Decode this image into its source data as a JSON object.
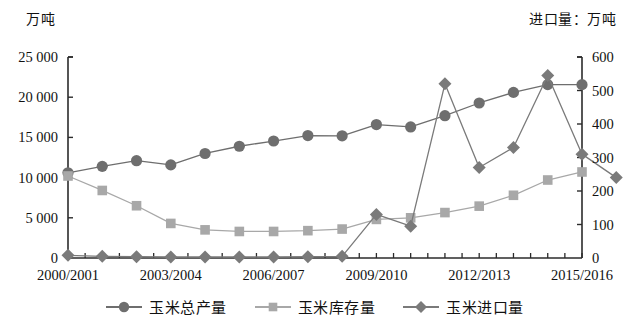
{
  "chart_data": {
    "type": "line",
    "title": "",
    "categories": [
      "2000/2001",
      "2001/2002",
      "2002/2003",
      "2003/2004",
      "2004/2005",
      "2005/2006",
      "2006/2007",
      "2007/2008",
      "2008/2009",
      "2009/2010",
      "2010/2011",
      "2011/2012",
      "2012/2013",
      "2013/2014",
      "2014/2015",
      "2015/2016"
    ],
    "x_tick_labels": [
      "2000/2001",
      "2003/2004",
      "2006/2007",
      "2009/2010",
      "2012/2013",
      "2015/2016"
    ],
    "x_tick_indices": [
      0,
      3,
      6,
      9,
      12,
      15
    ],
    "left_axis": {
      "label": "万吨",
      "ticks": [
        "0",
        "5 000",
        "10 000",
        "15 000",
        "20 000",
        "25 000"
      ],
      "values": [
        0,
        5000,
        10000,
        15000,
        20000,
        25000
      ],
      "min": 0,
      "max": 25000
    },
    "right_axis": {
      "label": "进口量：万吨",
      "ticks": [
        "0",
        "100",
        "200",
        "300",
        "400",
        "500",
        "600"
      ],
      "values": [
        0,
        100,
        200,
        300,
        400,
        500,
        600
      ],
      "min": 0,
      "max": 600
    },
    "grid": false,
    "legend_position": "bottom",
    "series": [
      {
        "name": "玉米总产量",
        "marker": "circle",
        "axis": "left",
        "color": "#6e6e6e",
        "values": [
          10600,
          11400,
          12100,
          11580,
          13000,
          13900,
          14550,
          15230,
          15200,
          16600,
          16300,
          17700,
          19280,
          20600,
          21560,
          21560
        ]
      },
      {
        "name": "玉米库存量",
        "marker": "square",
        "axis": "left",
        "color": "#a8a8a8",
        "values": [
          10200,
          8400,
          6500,
          4300,
          3500,
          3300,
          3300,
          3400,
          3600,
          4800,
          5000,
          5650,
          6450,
          7800,
          9700,
          10700
        ]
      },
      {
        "name": "玉米进口量",
        "marker": "diamond",
        "axis": "right",
        "color": "#7a7a7a",
        "values": [
          8,
          5,
          4,
          3,
          3,
          3,
          3,
          4,
          5,
          130,
          95,
          520,
          270,
          330,
          545,
          310
        ]
      }
    ],
    "series_tail": {
      "note": "last import point",
      "values": [
        240
      ]
    }
  },
  "legend": {
    "items": [
      {
        "label": "玉米总产量",
        "marker": "circle"
      },
      {
        "label": "玉米库存量",
        "marker": "square"
      },
      {
        "label": "玉米进口量",
        "marker": "diamond"
      }
    ]
  },
  "colors": {
    "series1": "#6e6e6e",
    "series2": "#a8a8a8",
    "series3": "#7a7a7a",
    "axis": "#2b2b2b",
    "background": "#ffffff"
  }
}
